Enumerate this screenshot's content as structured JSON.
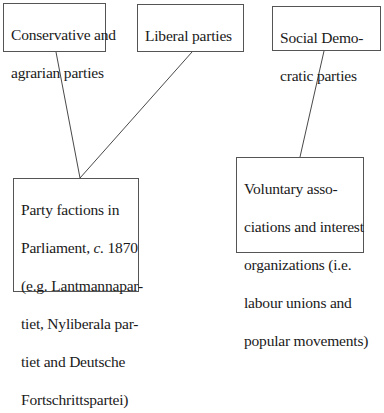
{
  "diagram": {
    "nodes": {
      "conservative": {
        "lines": [
          "Conservative and",
          "agrarian parties"
        ]
      },
      "liberal": {
        "lines": [
          "Liberal parties"
        ]
      },
      "social_democratic": {
        "lines": [
          "Social Demo-",
          "cratic parties"
        ]
      },
      "party_factions": {
        "line1": "Party factions in",
        "line2_pre": "Parliament, ",
        "line2_ital": "c.",
        "line2_post": " 1870",
        "line3": "(e.g. Lantmannapar-",
        "line4": "tiet, Nyliberala par-",
        "line5": "tiet and Deutsche",
        "line6": "Fortschrittspartei)"
      },
      "voluntary": {
        "lines": [
          "Voluntary asso-",
          "ciations and interest",
          "organizations (i.e.",
          "labour unions and",
          "popular movements)"
        ]
      }
    },
    "edges": [
      {
        "from": "conservative",
        "to": "party_factions"
      },
      {
        "from": "liberal",
        "to": "party_factions"
      },
      {
        "from": "social_democratic",
        "to": "voluntary"
      }
    ],
    "colors": {
      "line": "#333333",
      "border": "#555555",
      "text": "#1a1a1a",
      "background": "#ffffff"
    }
  }
}
